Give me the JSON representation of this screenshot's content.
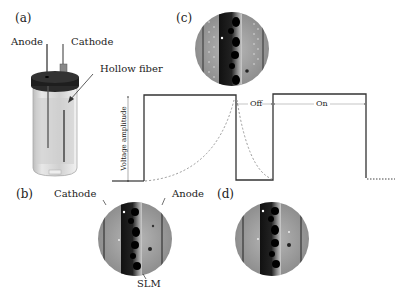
{
  "panels": {
    "a": "(a)",
    "b": "(b)",
    "c": "(c)",
    "d": "(d)"
  },
  "cell_labels": {
    "anode": "Anode",
    "cathode": "Cathode",
    "hollow_fiber": "Hollow fiber"
  },
  "membrane_labels": {
    "cathode": "Cathode",
    "anode": "Anode",
    "slm": "SLM"
  },
  "waveform": {
    "y_axis_label": "Voltage amplitude",
    "off_label": "Off",
    "on_label": "On"
  },
  "colors": {
    "line": "#333333",
    "dashed": "#999999",
    "circle_bg": "#9a9a9a",
    "fiber_dark": "#1a1a1a"
  }
}
